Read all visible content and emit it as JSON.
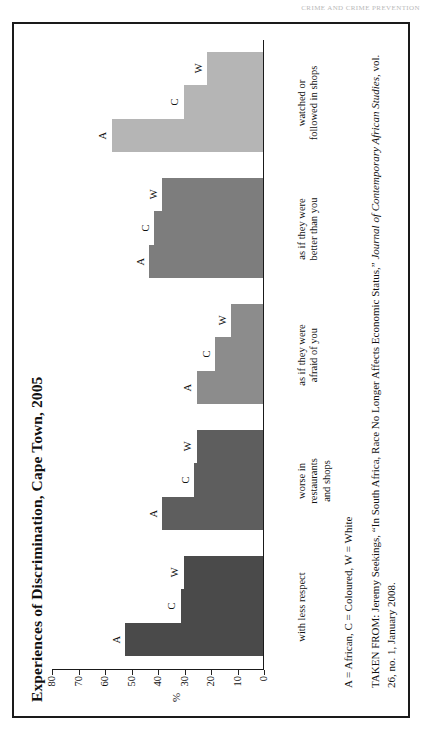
{
  "page": {
    "running_head": "CRIME AND CRIME PREVENTION"
  },
  "figure": {
    "title": "Experiences of Discrimination, Cape Town, 2005",
    "y_axis_label": "%",
    "legend_note": "A = African,  C = Coloured,  W = White",
    "source_prefix": "TAKEN FROM: Jeremy Seekings, “In South Africa, Race No Longer Affects Economic Status,” ",
    "source_journal": "Journal of Contemporary African Studies",
    "source_suffix": ", vol. 26, no. 1, January 2008."
  },
  "chart_data": {
    "type": "bar",
    "title": "Experiences of Discrimination, Cape Town, 2005",
    "xlabel": "",
    "ylabel": "%",
    "ylim": [
      0,
      80
    ],
    "yticks": [
      80,
      70,
      60,
      50,
      40,
      30,
      20,
      10,
      0
    ],
    "grid": false,
    "legend_position": "in-bar-labels",
    "categories": [
      "with less respect",
      "worse in\nrestaurants\nand shops",
      "as if they were\nafraid of you",
      "as if they were\nbetter than you",
      "watched or\nfollowed in shops"
    ],
    "category_lines": [
      [
        "with less respect"
      ],
      [
        "worse in",
        "restaurants",
        "and shops"
      ],
      [
        "as if they were",
        "afraid of you"
      ],
      [
        "as if they were",
        "better than you"
      ],
      [
        "watched or",
        "followed in shops"
      ]
    ],
    "series": [
      {
        "name": "A",
        "label": "African",
        "values": [
          52,
          38,
          25,
          43,
          57
        ]
      },
      {
        "name": "C",
        "label": "Coloured",
        "values": [
          31,
          26,
          18,
          41,
          30
        ]
      },
      {
        "name": "W",
        "label": "White",
        "values": [
          30,
          25,
          12,
          38,
          21
        ]
      }
    ],
    "group_colors": [
      "#4a4a4a",
      "#5e5e5e",
      "#8c8c8c",
      "#7d7d7d",
      "#b5b5b5"
    ]
  }
}
